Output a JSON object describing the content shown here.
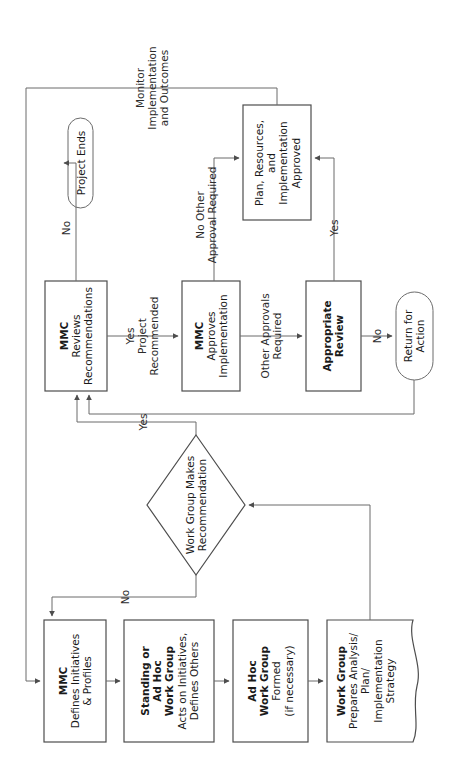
{
  "diagram": {
    "orientation": "rotated-90-counterclockwise",
    "colors": {
      "node_stroke": "#4d4d4d",
      "connector_stroke": "#6b6b6b",
      "node_fill": "#ffffff",
      "text": "#1a1a1a",
      "background": "#ffffff"
    },
    "nodes": [
      {
        "id": "mmc-defines",
        "shape": "rectangle",
        "bold_lines": [
          "MMC"
        ],
        "lines": [
          "Defines Initiatives",
          "& Profiles"
        ]
      },
      {
        "id": "standing-ad-hoc-work-group",
        "shape": "rectangle",
        "bold_lines": [
          "Standing or",
          "Ad Hoc",
          "Work Group"
        ],
        "lines": [
          "Acts on Initiatives,",
          "Defines Others"
        ]
      },
      {
        "id": "ad-hoc-work-group-formed",
        "shape": "rectangle",
        "bold_lines": [
          "Ad Hoc",
          "Work Group"
        ],
        "lines": [
          "Formed",
          "(if necessary)"
        ]
      },
      {
        "id": "work-group-prepares",
        "shape": "document",
        "bold_lines": [
          "Work Group"
        ],
        "lines": [
          "Prepares Analysis/",
          "Plan/",
          "Implementation",
          "Strategy"
        ]
      },
      {
        "id": "work-group-makes-recommendation",
        "shape": "diamond",
        "bold_lines": [],
        "lines": [
          "Work Group Makes",
          "Recommendation"
        ]
      },
      {
        "id": "mmc-reviews",
        "shape": "rectangle",
        "bold_lines": [
          "MMC"
        ],
        "lines": [
          "Reviews",
          "Recommendations"
        ]
      },
      {
        "id": "mmc-approves",
        "shape": "rectangle",
        "bold_lines": [
          "MMC"
        ],
        "lines": [
          "Approves",
          "Implementation"
        ]
      },
      {
        "id": "appropriate-review",
        "shape": "rectangle",
        "bold_lines": [
          "Appropriate",
          "Review"
        ],
        "lines": []
      },
      {
        "id": "return-for-action",
        "shape": "stadium",
        "bold_lines": [],
        "lines": [
          "Return for",
          "Action"
        ]
      },
      {
        "id": "plan-resources-approved",
        "shape": "rectangle",
        "bold_lines": [],
        "lines": [
          "Plan, Resources,",
          "and",
          "Implementation",
          "Approved"
        ]
      },
      {
        "id": "project-ends",
        "shape": "stadium",
        "bold_lines": [],
        "lines": [
          "Project Ends"
        ]
      }
    ],
    "edge_labels": [
      {
        "id": "yes-diamond",
        "lines": [
          "Yes"
        ]
      },
      {
        "id": "no-diamond",
        "lines": [
          "No"
        ]
      },
      {
        "id": "yes-project-recommended",
        "lines": [
          "Yes",
          "Project",
          "Recommended"
        ]
      },
      {
        "id": "other-approvals-required",
        "lines": [
          "Other Approvals",
          "Required"
        ]
      },
      {
        "id": "no-appropriate-review",
        "lines": [
          "No"
        ]
      },
      {
        "id": "yes-appropriate-review",
        "lines": [
          "Yes"
        ]
      },
      {
        "id": "no-other-approval-required",
        "lines": [
          "No Other",
          "Approval Required"
        ]
      },
      {
        "id": "no-project-ends",
        "lines": [
          "No"
        ]
      },
      {
        "id": "monitor-implementation",
        "lines": [
          "Monitor",
          "Implementation",
          "and Outcomes"
        ]
      }
    ]
  }
}
